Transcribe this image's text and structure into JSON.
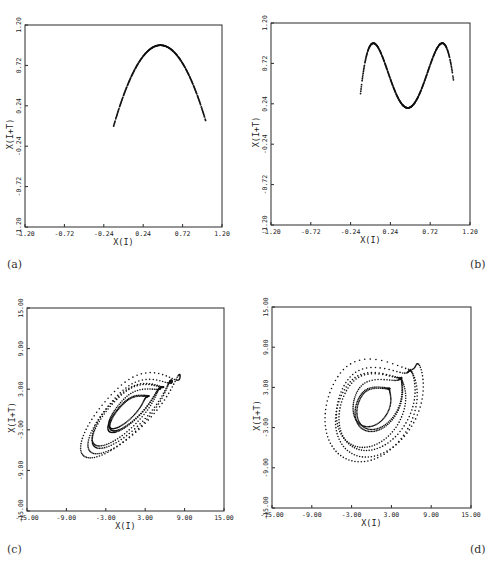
{
  "figure": {
    "panel_labels": [
      "(a)",
      "(b)",
      "(c)",
      "(d)"
    ]
  },
  "chart_data": [
    {
      "id": "a",
      "type": "scatter",
      "panel_label": "(a)",
      "xlabel": "X(I)",
      "ylabel": "X(I+T)",
      "xlim": [
        -1.2,
        1.2
      ],
      "ylim": [
        -1.2,
        1.2
      ],
      "xticks": [
        "-1.20",
        "-0.72",
        "-0.24",
        "0.24",
        "0.72",
        "1.20"
      ],
      "yticks": [
        "-1.20",
        "-0.72",
        "-0.24",
        "0.24",
        "0.72",
        "1.20"
      ],
      "grid": false,
      "description": "Single-hump return map (parabola)",
      "curve": {
        "kind": "parabola",
        "x_range": [
          -0.12,
          1.0
        ],
        "peak_x": 0.45,
        "peak_y": 0.96,
        "end_y": 0.0
      }
    },
    {
      "id": "b",
      "type": "scatter",
      "panel_label": "(b)",
      "xlabel": "X(I)",
      "ylabel": "X(I+T)",
      "xlim": [
        -1.2,
        1.2
      ],
      "ylim": [
        -1.2,
        1.2
      ],
      "xticks": [
        "-1.20",
        "-0.72",
        "-0.24",
        "0.24",
        "0.72",
        "1.20"
      ],
      "yticks": [
        "-1.20",
        "-0.72",
        "-0.24",
        "0.24",
        "0.72",
        "1.20"
      ],
      "grid": false,
      "description": "Twice-iterated map with two humps",
      "curve": {
        "kind": "double_hump",
        "x_range": [
          -0.12,
          1.0
        ],
        "peaks_x": [
          0.14,
          0.81
        ],
        "peak_y": 0.96,
        "trough_x": 0.45,
        "trough_y": 0.0
      }
    },
    {
      "id": "c",
      "type": "scatter",
      "panel_label": "(c)",
      "xlabel": "X(I)",
      "ylabel": "X(I+T)",
      "xlim": [
        -15,
        15
      ],
      "ylim": [
        -15,
        15
      ],
      "xticks": [
        "-15.00",
        "-9.00",
        "-3.00",
        "3.00",
        "9.00",
        "15.00"
      ],
      "yticks": [
        "-15.00",
        "-9.00",
        "-3.00",
        "3.00",
        "9.00",
        "15.00"
      ],
      "grid": false,
      "description": "Reconstructed strange attractor, elongated along the diagonal",
      "curve": {
        "kind": "spiral_attractor",
        "center": [
          0.5,
          0.0
        ],
        "tilt_deg": 45,
        "loops": 7,
        "r_min": 3.2,
        "r_max": 10.5,
        "aspect": 0.34,
        "flare": [
          10.5,
          -2.0
        ]
      }
    },
    {
      "id": "d",
      "type": "scatter",
      "panel_label": "(d)",
      "xlabel": "X(I)",
      "ylabel": "X(I+T)",
      "xlim": [
        -15,
        15
      ],
      "ylim": [
        -15,
        15
      ],
      "xticks": [
        "-15.00",
        "-9.00",
        "-3.00",
        "3.00",
        "9.00",
        "15.00"
      ],
      "yticks": [
        "-15.00",
        "-9.00",
        "-3.00",
        "3.00",
        "9.00",
        "15.00"
      ],
      "grid": false,
      "description": "Reconstructed strange attractor with larger delay, rounder loops",
      "curve": {
        "kind": "spiral_attractor",
        "center": [
          0.5,
          0.5
        ],
        "tilt_deg": 62,
        "loops": 7,
        "r_min": 3.0,
        "r_max": 10.0,
        "aspect": 0.72,
        "flare": [
          11.5,
          -2.0
        ]
      }
    }
  ]
}
